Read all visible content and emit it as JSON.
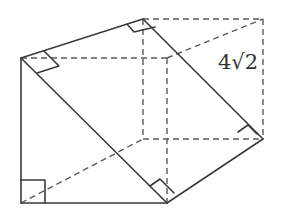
{
  "figure": {
    "type": "3d-prism-diagram",
    "label": "4√2",
    "label_meaning": "vertical edge length",
    "stroke_color": "#3a3a3a",
    "vertices": {
      "A": [
        21,
        58
      ],
      "B": [
        143,
        19
      ],
      "C": [
        263,
        19
      ],
      "D": [
        263,
        139
      ],
      "E": [
        167,
        203
      ],
      "F": [
        21,
        203
      ],
      "G": [
        167,
        58
      ],
      "H": [
        143,
        139
      ]
    },
    "right_angle_marks": 6
  }
}
